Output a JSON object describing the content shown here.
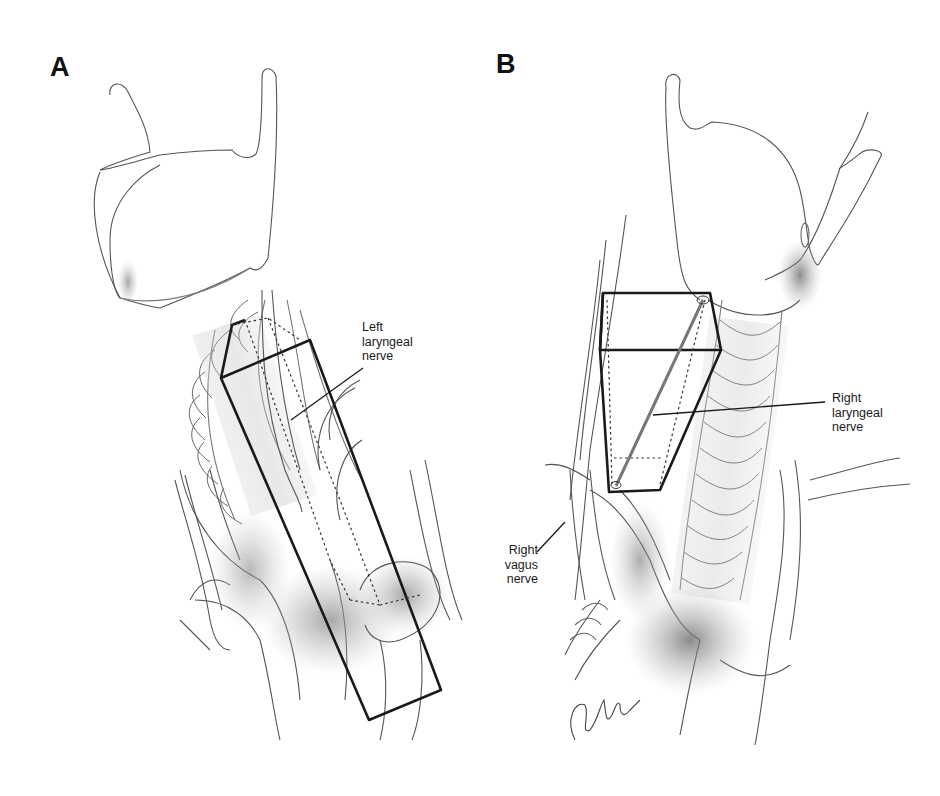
{
  "figure": {
    "panels": [
      {
        "letter": "A",
        "labels": [
          {
            "id": "left-laryngeal-nerve",
            "text": "Left\nlaryngeal\nnerve"
          }
        ]
      },
      {
        "letter": "B",
        "labels": [
          {
            "id": "right-laryngeal-nerve",
            "text": "Right\nlaryngeal\nnerve"
          },
          {
            "id": "right-vagus-nerve",
            "text": "Right\nvagus\nnerve"
          }
        ]
      }
    ],
    "caption": {
      "visible_state": "truncated",
      "text": ""
    },
    "colors": {
      "line": "#1a1a1a",
      "sketch": "#555555",
      "shade": "#9a9a9a",
      "background": "#ffffff"
    }
  }
}
